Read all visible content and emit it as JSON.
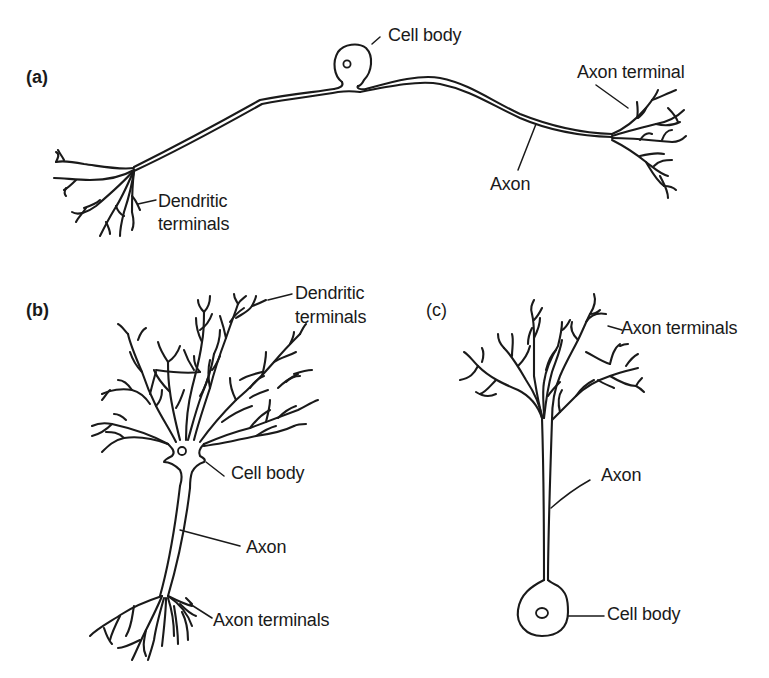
{
  "figure": {
    "panels": [
      {
        "id": "a",
        "tag": "(a)",
        "tag_bold": true,
        "labels": {
          "cell_body": "Cell body",
          "axon_terminal": "Axon terminal",
          "axon": "Axon",
          "dendritic_terminals_line1": "Dendritic",
          "dendritic_terminals_line2": "terminals"
        }
      },
      {
        "id": "b",
        "tag": "(b)",
        "tag_bold": true,
        "labels": {
          "dendritic_terminals_line1": "Dendritic",
          "dendritic_terminals_line2": "terminals",
          "cell_body": "Cell body",
          "axon": "Axon",
          "axon_terminals": "Axon terminals"
        }
      },
      {
        "id": "c",
        "tag": "(c)",
        "tag_bold": false,
        "labels": {
          "axon_terminals": "Axon terminals",
          "axon": "Axon",
          "cell_body": "Cell body"
        }
      }
    ]
  },
  "colors": {
    "ink": "#1a1a1a",
    "background": "#ffffff"
  }
}
